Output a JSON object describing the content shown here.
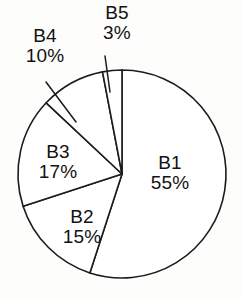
{
  "chart_data": {
    "type": "pie",
    "title": "",
    "subtitle": "",
    "xlabel": "",
    "ylabel": "",
    "legend_position": "none",
    "grid": false,
    "units": "percent",
    "start_angle_deg": 0,
    "direction": "clockwise",
    "categories": [
      "B1",
      "B2",
      "B3",
      "B4",
      "B5"
    ],
    "values": [
      55,
      15,
      17,
      10,
      3
    ],
    "slices": [
      {
        "label": "B1",
        "value": 55,
        "value_text": "55%",
        "label_placement": "inside",
        "leader_line": false,
        "fill": "#ffffff",
        "stroke": "#1c1c1c"
      },
      {
        "label": "B2",
        "value": 15,
        "value_text": "15%",
        "label_placement": "inside",
        "leader_line": false,
        "fill": "#ffffff",
        "stroke": "#1c1c1c"
      },
      {
        "label": "B3",
        "value": 17,
        "value_text": "17%",
        "label_placement": "inside",
        "leader_line": false,
        "fill": "#ffffff",
        "stroke": "#1c1c1c"
      },
      {
        "label": "B4",
        "value": 10,
        "value_text": "10%",
        "label_placement": "outside",
        "leader_line": true,
        "fill": "#ffffff",
        "stroke": "#1c1c1c"
      },
      {
        "label": "B5",
        "value": 3,
        "value_text": "3%",
        "label_placement": "outside",
        "leader_line": true,
        "fill": "#ffffff",
        "stroke": "#1c1c1c"
      }
    ],
    "colors": {
      "background": "#fdfdfc",
      "outline": "#1c1c1c",
      "slice_fill": "#ffffff",
      "text": "#121212"
    }
  }
}
